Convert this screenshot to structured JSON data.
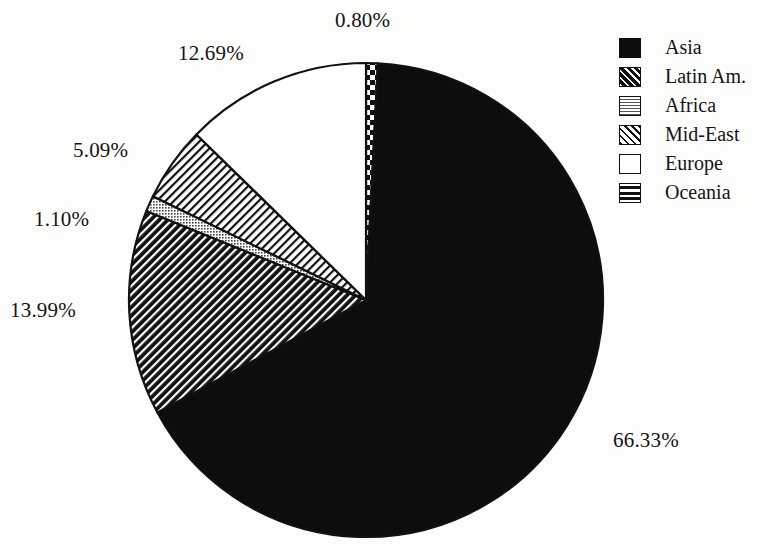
{
  "chart_data": {
    "type": "pie",
    "title": "",
    "subtitle": "",
    "xlabel": "",
    "ylabel": "",
    "legend_position": "right",
    "grid": false,
    "start_angle_deg": 0,
    "direction": "clockwise",
    "categories": [
      "Oceania",
      "Asia",
      "Latin Am.",
      "Africa",
      "Mid-East",
      "Europe"
    ],
    "values": [
      0.8,
      66.33,
      13.99,
      1.1,
      5.09,
      12.69
    ],
    "value_labels": [
      "0.80%",
      "66.33%",
      "13.99%",
      "1.10%",
      "5.09%",
      "12.69%"
    ],
    "slices": [
      {
        "label": "Oceania",
        "value": 0.8,
        "value_label": "0.80%",
        "pattern": "blocks",
        "fill": "#ffffff",
        "stroke": "#111111",
        "label_x": 335,
        "label_y": 8
      },
      {
        "label": "Asia",
        "value": 66.33,
        "value_label": "66.33%",
        "pattern": "solid",
        "fill": "#0d0d0d",
        "stroke": "#111111",
        "label_x": 613,
        "label_y": 428
      },
      {
        "label": "Latin Am.",
        "value": 13.99,
        "value_label": "13.99%",
        "pattern": "dark-diagonal-hatch",
        "fill": "#111111",
        "stroke": "#111111",
        "label_x": 10,
        "label_y": 298
      },
      {
        "label": "Africa",
        "value": 1.1,
        "value_label": "1.10%",
        "pattern": "gray-dot-grid",
        "fill": "#8a8a8a",
        "stroke": "#111111",
        "label_x": 34,
        "label_y": 207
      },
      {
        "label": "Mid-East",
        "value": 5.09,
        "value_label": "5.09%",
        "pattern": "light-diagonal-hatch",
        "fill": "#ffffff",
        "stroke": "#111111",
        "label_x": 73,
        "label_y": 138
      },
      {
        "label": "Europe",
        "value": 12.69,
        "value_label": "12.69%",
        "pattern": "empty",
        "fill": "#ffffff",
        "stroke": "#111111",
        "label_x": 178,
        "label_y": 41
      }
    ],
    "geometry": {
      "center_x": 366,
      "center_y": 300,
      "radius": 237
    }
  },
  "legend": {
    "items": [
      {
        "label": "Asia",
        "swatch": "solid",
        "swatch_class": "sw-solid"
      },
      {
        "label": "Latin Am.",
        "swatch": "dark-diagonal-hatch",
        "swatch_class": "sw-darkhatch"
      },
      {
        "label": "Africa",
        "swatch": "gray-dot-grid",
        "swatch_class": "sw-dotgray"
      },
      {
        "label": "Mid-East",
        "swatch": "light-diagonal-hatch",
        "swatch_class": "sw-lighthatch"
      },
      {
        "label": "Europe",
        "swatch": "empty",
        "swatch_class": "sw-empty"
      },
      {
        "label": "Oceania",
        "swatch": "blocks",
        "swatch_class": "sw-blocks"
      }
    ]
  },
  "colors": {
    "ink": "#111111",
    "paper": "#fdfdfc",
    "asia_fill": "#0d0d0d",
    "africa_fill": "#8a8a8a"
  }
}
